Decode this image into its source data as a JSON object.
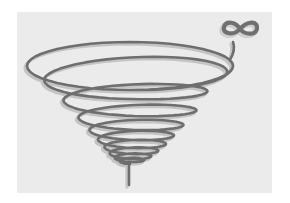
{
  "diagram": {
    "type": "spiral-funnel-infinity",
    "symbol": "∞",
    "symbol_icon": "infinity-icon",
    "colors": {
      "background": "#ffffff",
      "panel": "#ebebeb",
      "stroke": "#6e6e6e",
      "shadow": "#bdbdbd"
    },
    "spiral": {
      "coil_count": 10,
      "coils": [
        {
          "cx": 130,
          "cy": 66,
          "rx": 103,
          "ry": 24
        },
        {
          "cx": 130,
          "cy": 86,
          "rx": 80,
          "ry": 13
        },
        {
          "cx": 134,
          "cy": 106,
          "rx": 66,
          "ry": 10
        },
        {
          "cx": 134,
          "cy": 122,
          "rx": 52,
          "ry": 8
        },
        {
          "cx": 134,
          "cy": 133,
          "rx": 42,
          "ry": 7
        },
        {
          "cx": 134,
          "cy": 142,
          "rx": 34,
          "ry": 6
        },
        {
          "cx": 133,
          "cy": 149,
          "rx": 27,
          "ry": 5
        },
        {
          "cx": 132,
          "cy": 155,
          "rx": 21,
          "ry": 4
        },
        {
          "cx": 131,
          "cy": 159,
          "rx": 15,
          "ry": 3
        },
        {
          "cx": 130,
          "cy": 162,
          "rx": 9,
          "ry": 2
        }
      ],
      "stem": {
        "x": 129,
        "y1": 163,
        "y2": 185
      }
    }
  }
}
